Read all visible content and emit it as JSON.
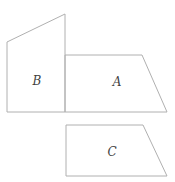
{
  "canvas": {
    "width": 175,
    "height": 182,
    "background": "#ffffff",
    "stroke_color": "#b0b0b0",
    "stroke_width": 1,
    "label_color": "#3f3f3f",
    "label_font_size": 12
  },
  "shapes": [
    {
      "name": "quadrilateral-b",
      "label": "B",
      "points": [
        [
          7,
          42
        ],
        [
          65,
          14
        ],
        [
          65,
          112
        ],
        [
          7,
          112
        ]
      ],
      "label_pos": [
        37,
        81
      ]
    },
    {
      "name": "trapezoid-a",
      "label": "A",
      "points": [
        [
          65,
          55
        ],
        [
          142,
          55
        ],
        [
          167,
          112
        ],
        [
          65,
          112
        ]
      ],
      "label_pos": [
        117,
        82
      ]
    },
    {
      "name": "trapezoid-c",
      "label": "C",
      "points": [
        [
          66,
          125
        ],
        [
          143,
          125
        ],
        [
          167,
          176
        ],
        [
          66,
          176
        ]
      ],
      "label_pos": [
        112,
        152
      ]
    }
  ]
}
